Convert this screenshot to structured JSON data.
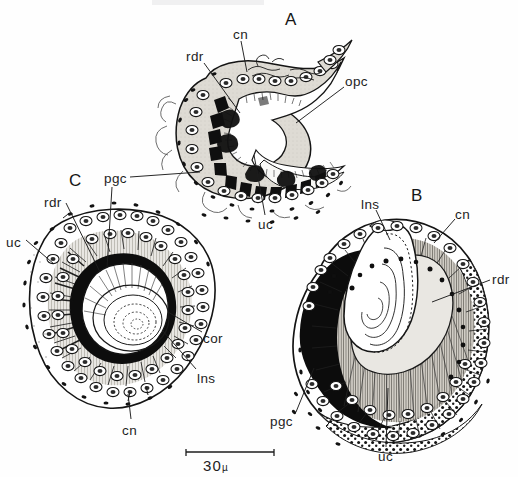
{
  "figure": {
    "kind": "histological-line-drawing",
    "title_text": "",
    "panels": [
      {
        "id": "A",
        "letter": "A",
        "letter_x": 285,
        "letter_y": 11
      },
      {
        "id": "B",
        "letter": "B",
        "letter_x": 411,
        "letter_y": 187
      },
      {
        "id": "C",
        "letter": "C",
        "letter_x": 69,
        "letter_y": 172
      }
    ],
    "labels": [
      {
        "text": "cn",
        "x": 233,
        "y": 28,
        "panel": "A",
        "name": "label-cn-panel-a"
      },
      {
        "text": "rdr",
        "x": 186,
        "y": 50,
        "panel": "A",
        "name": "label-rdr-panel-a"
      },
      {
        "text": "opc",
        "x": 345,
        "y": 75,
        "panel": "A",
        "name": "label-opc-panel-a"
      },
      {
        "text": "uc",
        "x": 258,
        "y": 218,
        "panel": "A",
        "name": "label-uc-panel-a"
      },
      {
        "text": "pgc",
        "x": 104,
        "y": 172,
        "panel": "A",
        "name": "label-pgc-shared"
      },
      {
        "text": "rdr",
        "x": 44,
        "y": 196,
        "panel": "C",
        "name": "label-rdr-panel-c"
      },
      {
        "text": "uc",
        "x": 6,
        "y": 236,
        "panel": "C",
        "name": "label-uc-panel-c"
      },
      {
        "text": "cor",
        "x": 203,
        "y": 332,
        "panel": "C",
        "name": "label-cor-panel-c"
      },
      {
        "text": "lns",
        "x": 197,
        "y": 372,
        "panel": "C",
        "name": "label-lns-panel-c"
      },
      {
        "text": "cn",
        "x": 122,
        "y": 424,
        "panel": "C",
        "name": "label-cn-panel-c"
      },
      {
        "text": "lns",
        "x": 361,
        "y": 198,
        "panel": "B",
        "name": "label-lns-panel-b"
      },
      {
        "text": "cn",
        "x": 455,
        "y": 208,
        "panel": "B",
        "name": "label-cn-panel-b"
      },
      {
        "text": "rdr",
        "x": 492,
        "y": 273,
        "panel": "B",
        "name": "label-rdr-panel-b"
      },
      {
        "text": "pgc",
        "x": 270,
        "y": 415,
        "panel": "B",
        "name": "label-pgc-panel-b"
      },
      {
        "text": "uc",
        "x": 378,
        "y": 450,
        "panel": "B",
        "name": "label-uc-panel-b"
      }
    ],
    "abbreviation_glossary": [
      "cn",
      "rdr",
      "opc",
      "uc",
      "pgc",
      "cor",
      "lns"
    ],
    "scalebar": {
      "value": "30",
      "unit": "µ",
      "bar_x": 186,
      "bar_y": 452,
      "bar_width": 88,
      "text_x": 203,
      "text_y": 457
    },
    "colors": {
      "ink": "#1b1b1b",
      "paper": "#fefefe",
      "cytoplasm_fill": "#d9d6cf",
      "light_fill": "#f2f1ee",
      "lens_fill": "#ffffff",
      "pigment_fill": "#111111",
      "stipple": "#2a2a2a"
    }
  }
}
